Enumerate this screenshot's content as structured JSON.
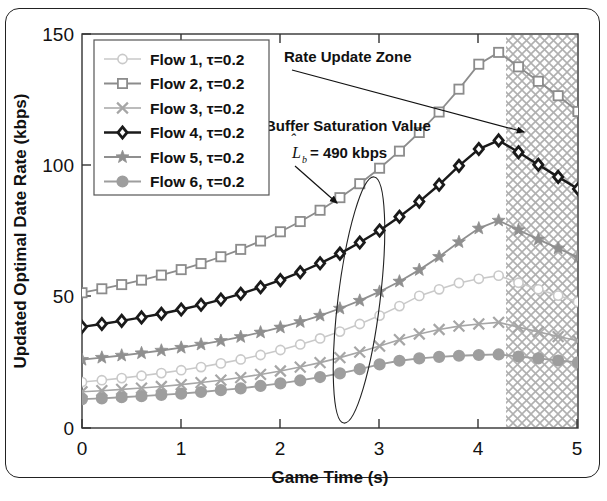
{
  "chart_data": {
    "type": "line",
    "title": "",
    "xlabel": "Game Time (s)",
    "ylabel": "Updated Optimal Date Rate (kbps)",
    "xlim": [
      0,
      5
    ],
    "ylim": [
      0,
      150
    ],
    "xticks": [
      "0",
      "1",
      "2",
      "3",
      "4",
      "5"
    ],
    "xtick_values": [
      0,
      1,
      2,
      3,
      4,
      5
    ],
    "yticks": [
      "0",
      "50",
      "100",
      "150"
    ],
    "ytick_values": [
      0,
      50,
      100,
      150
    ],
    "grid": false,
    "legend_position": "upper-left",
    "x": [
      0,
      0.2,
      0.4,
      0.6,
      0.8,
      1.0,
      1.2,
      1.4,
      1.6,
      1.8,
      2.0,
      2.2,
      2.4,
      2.6,
      2.8,
      3.0,
      3.2,
      3.4,
      3.6,
      3.8,
      4.0,
      4.2,
      4.4,
      4.6,
      4.8,
      5.0
    ],
    "series": [
      {
        "name": "Flow 1, τ=0.2",
        "marker": "circle-open",
        "color": "#c9c9c9",
        "linewidth": 1.6,
        "values": [
          17.5,
          18.2,
          19.0,
          19.9,
          20.9,
          22.0,
          23.2,
          24.6,
          26.1,
          27.8,
          29.7,
          31.8,
          34.1,
          36.7,
          39.6,
          42.8,
          46.4,
          50.3,
          52.8,
          55.2,
          56.8,
          58.0,
          55.3,
          52.8,
          50.4,
          48.0
        ]
      },
      {
        "name": "Flow 2, τ=0.2",
        "marker": "square-open",
        "color": "#8c8c8c",
        "linewidth": 1.8,
        "values": [
          51.5,
          53.0,
          54.6,
          56.3,
          58.2,
          60.3,
          62.6,
          65.2,
          68.0,
          71.2,
          74.7,
          78.6,
          82.9,
          87.7,
          93.0,
          98.9,
          105.4,
          112.5,
          120.3,
          129.0,
          138.5,
          143.0,
          137.5,
          132.0,
          126.5,
          120.5
        ]
      },
      {
        "name": "Flow 3, τ=0.2",
        "marker": "x-cross",
        "color": "#a6a6a6",
        "linewidth": 1.6,
        "values": [
          13.8,
          14.2,
          14.7,
          15.2,
          15.8,
          16.5,
          17.3,
          18.2,
          19.2,
          20.4,
          21.7,
          23.2,
          24.9,
          26.8,
          28.9,
          31.2,
          33.6,
          35.8,
          37.5,
          38.8,
          39.6,
          40.2,
          38.4,
          36.6,
          34.8,
          33.2
        ]
      },
      {
        "name": "Flow 4, τ=0.2",
        "marker": "diamond-open",
        "color": "#1a1a1a",
        "linewidth": 2.4,
        "values": [
          38.5,
          39.6,
          40.8,
          42.1,
          43.5,
          45.1,
          46.9,
          48.9,
          51.1,
          53.6,
          56.3,
          59.3,
          62.7,
          66.4,
          70.6,
          75.2,
          80.4,
          86.2,
          92.6,
          99.8,
          106.2,
          109.5,
          105.0,
          100.2,
          95.6,
          91.0
        ]
      },
      {
        "name": "Flow 5, τ=0.2",
        "marker": "star",
        "color": "#8f8f8f",
        "linewidth": 1.8,
        "values": [
          26.0,
          26.8,
          27.6,
          28.5,
          29.5,
          30.6,
          31.8,
          33.2,
          34.7,
          36.4,
          38.3,
          40.4,
          42.8,
          45.5,
          48.5,
          51.9,
          55.8,
          60.2,
          65.2,
          70.8,
          76.0,
          79.0,
          75.4,
          71.8,
          68.4,
          65.0
        ]
      },
      {
        "name": "Flow 6, τ=0.2",
        "marker": "circle-filled",
        "color": "#9e9e9e",
        "linewidth": 1.8,
        "values": [
          11.0,
          11.3,
          11.7,
          12.1,
          12.6,
          13.1,
          13.7,
          14.4,
          15.1,
          16.0,
          17.0,
          18.1,
          19.4,
          20.8,
          22.4,
          24.2,
          25.6,
          26.5,
          27.1,
          27.5,
          27.8,
          28.0,
          27.2,
          26.5,
          25.7,
          25.0
        ]
      }
    ],
    "annotations": [
      {
        "name": "rate-update-zone",
        "label": "Rate Update Zone",
        "type": "arrow-label",
        "target_x": 4.45,
        "target_y": 117
      },
      {
        "name": "buffer-saturation-value",
        "label": "Buffer Saturation Value",
        "math_symbol": "L",
        "math_subscript": "b",
        "math_value": "= 490 kbps",
        "type": "arrow-label-ellipse",
        "target_x": 2.82,
        "target_y": 96
      }
    ],
    "shaded_region": {
      "name": "rate-update-zone-hatch",
      "x_start": 4.28,
      "x_end": 5.0,
      "pattern": "crosshatch",
      "color": "#b5b5b5"
    }
  },
  "legend": {
    "entries": [
      {
        "label": "Flow 1, τ=0.2"
      },
      {
        "label": "Flow 2, τ=0.2"
      },
      {
        "label": "Flow 3, τ=0.2"
      },
      {
        "label": "Flow 4, τ=0.2"
      },
      {
        "label": "Flow 5, τ=0.2"
      },
      {
        "label": "Flow 6, τ=0.2"
      }
    ]
  },
  "axes": {
    "x_title": "Game Time (s)",
    "y_title": "Updated Optimal Date Rate (kbps)",
    "x_tick_0": "0",
    "x_tick_1": "1",
    "x_tick_2": "2",
    "x_tick_3": "3",
    "x_tick_4": "4",
    "x_tick_5": "5",
    "y_tick_0": "0",
    "y_tick_50": "50",
    "y_tick_100": "100",
    "y_tick_150": "150"
  },
  "annotations": {
    "rate_update_zone": "Rate Update Zone",
    "buffer_saturation": "Buffer Saturation Value",
    "buffer_symbol": "L",
    "buffer_subscript": "b",
    "buffer_value": "= 490 kbps"
  }
}
